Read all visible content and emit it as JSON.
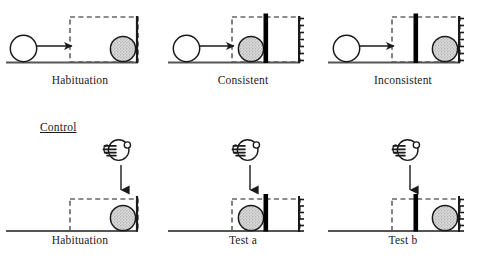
{
  "figure": {
    "title_visible": false,
    "background_color": "#ffffff",
    "stroke_color": "#1a1a1a",
    "ball_fill_color": "#d0d0d0",
    "ball_outline_color": "#1a1a1a",
    "screen_fill_color": "#ffffff",
    "barrier_color": "#000000",
    "dashed_box_color": "#1a1a1a",
    "ground_color": "#555555"
  },
  "section_labels": [
    {
      "id": "control",
      "text": "Control",
      "underline": true,
      "x": 40,
      "y": 121
    }
  ],
  "panels": [
    {
      "id": "panel-habituation-top",
      "row": "top",
      "label": "Habituation",
      "label_x": 80,
      "label_y": 74,
      "has_rolling_ball": true,
      "has_arrow": true,
      "arrow_direction": "right",
      "has_hand": false,
      "has_barrier": false,
      "barrier_position": null,
      "ball_position": "right",
      "right_wall_hatched": false
    },
    {
      "id": "panel-consistent",
      "row": "top",
      "label": "Consistent",
      "label_x": 243,
      "label_y": 74,
      "has_rolling_ball": true,
      "has_arrow": true,
      "arrow_direction": "right",
      "has_hand": false,
      "has_barrier": true,
      "barrier_position": "left",
      "ball_position": "left-of-barrier",
      "right_wall_hatched": true
    },
    {
      "id": "panel-inconsistent",
      "row": "top",
      "label": "Inconsistent",
      "label_x": 402,
      "label_y": 74,
      "has_rolling_ball": true,
      "has_arrow": true,
      "arrow_direction": "right",
      "has_hand": false,
      "has_barrier": true,
      "barrier_position": "left",
      "ball_position": "right-of-barrier",
      "right_wall_hatched": true
    },
    {
      "id": "panel-habituation-bottom",
      "row": "bottom",
      "label": "Habituation",
      "label_x": 80,
      "label_y": 234,
      "has_rolling_ball": false,
      "has_arrow": true,
      "arrow_direction": "down",
      "has_hand": true,
      "has_barrier": false,
      "barrier_position": null,
      "ball_position": "right",
      "right_wall_hatched": false
    },
    {
      "id": "panel-test-a",
      "row": "bottom",
      "label": "Test a",
      "label_x": 243,
      "label_y": 234,
      "has_rolling_ball": false,
      "has_arrow": true,
      "arrow_direction": "down",
      "has_hand": true,
      "has_barrier": true,
      "barrier_position": "left",
      "ball_position": "left-of-barrier",
      "right_wall_hatched": true
    },
    {
      "id": "panel-test-b",
      "row": "bottom",
      "label": "Test b",
      "label_x": 402,
      "label_y": 234,
      "has_rolling_ball": false,
      "has_arrow": true,
      "arrow_direction": "down",
      "has_hand": true,
      "has_barrier": true,
      "barrier_position": "left",
      "ball_position": "right-of-barrier",
      "right_wall_hatched": true
    }
  ],
  "icons": {
    "hand": "hand-dropping-ball-icon",
    "arrow_right": "arrow-right-icon",
    "arrow_down": "arrow-down-icon",
    "ball": "ball-icon",
    "barrier": "barrier-icon",
    "occluder": "dashed-occluder-box-icon"
  }
}
